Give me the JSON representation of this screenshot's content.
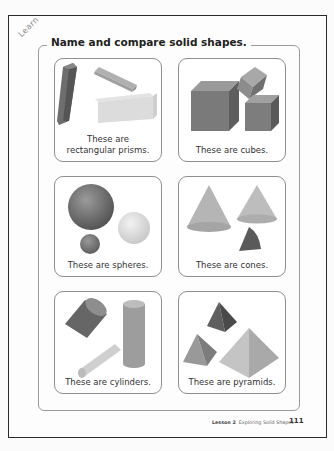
{
  "learn_label": "Learn",
  "title": "Name and compare solid shapes.",
  "cards": [
    {
      "shape": "rectangular-prism",
      "caption_line1": "These are",
      "caption_line2": "rectangular prisms."
    },
    {
      "shape": "cube",
      "caption_line1": "",
      "caption_line2": "These are cubes."
    },
    {
      "shape": "sphere",
      "caption_line1": "",
      "caption_line2": "These are spheres."
    },
    {
      "shape": "cone",
      "caption_line1": "",
      "caption_line2": "These are cones."
    },
    {
      "shape": "cylinder",
      "caption_line1": "",
      "caption_line2": "These are cylinders."
    },
    {
      "shape": "pyramid",
      "caption_line1": "",
      "caption_line2": "These are pyramids."
    }
  ],
  "footer": {
    "lesson": "Lesson 2",
    "lesson_title": "Exploring Solid Shapes",
    "page_number": "111"
  }
}
